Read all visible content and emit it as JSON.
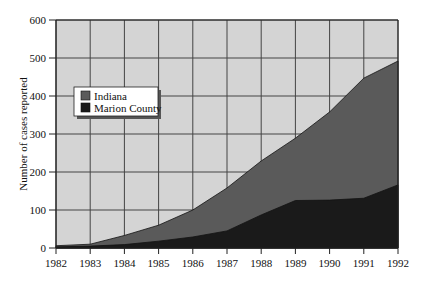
{
  "chart_data": {
    "type": "area",
    "stacked": false,
    "title": "",
    "xlabel": "",
    "ylabel": "Number of cases reported",
    "x": [
      1982,
      1983,
      1984,
      1985,
      1986,
      1987,
      1988,
      1989,
      1990,
      1991,
      1992
    ],
    "x_tick_labels": [
      "1982",
      "1983",
      "1984",
      "1985",
      "1986",
      "1987",
      "1988",
      "1989",
      "1990",
      "1991",
      "1992"
    ],
    "y_ticks": [
      0,
      100,
      200,
      300,
      400,
      500,
      600
    ],
    "y_tick_labels": [
      "0",
      "100",
      "200",
      "300",
      "400",
      "500",
      "600"
    ],
    "ylim": [
      0,
      600
    ],
    "xlim": [
      1982,
      1992
    ],
    "grid": true,
    "legend_position": "upper left (inside plot)",
    "series": [
      {
        "name": "Indiana",
        "color": "#5a5a5a",
        "values": [
          6,
          10,
          33,
          60,
          100,
          158,
          229,
          289,
          358,
          447,
          492
        ]
      },
      {
        "name": "Marion County",
        "color": "#1a1a1a",
        "values": [
          3,
          5,
          9,
          18,
          29,
          45,
          87,
          125,
          126,
          131,
          166
        ]
      }
    ],
    "colors": {
      "plot_background": "#d4d4d4",
      "gridline": "#444444",
      "axis": "#222222"
    }
  },
  "legend": {
    "items": [
      {
        "label": "Indiana",
        "color": "#5a5a5a"
      },
      {
        "label": "Marion County",
        "color": "#1a1a1a"
      }
    ]
  }
}
